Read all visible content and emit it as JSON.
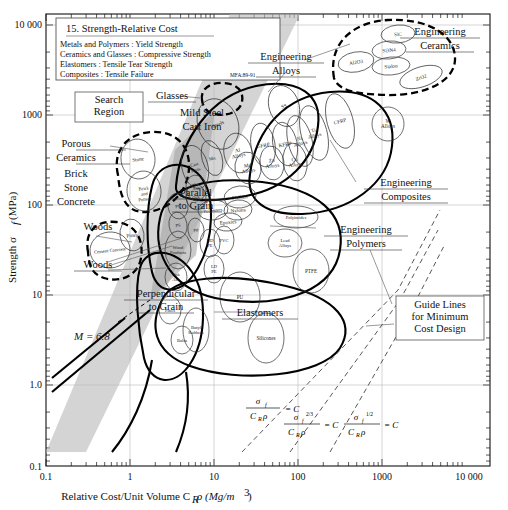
{
  "chart_data": {
    "type": "scatter",
    "title": "15. Strength-Relative Cost",
    "subtitle_lines": [
      "Metals and Polymers : Yield Strength",
      "Ceramics and Glasses : Compressive Strength",
      "Elastomers : Tensile Tear Strength",
      "Composites : Tensile Failure"
    ],
    "credit": "MFA:89-91",
    "xlabel": "Relative Cost/Unit Volume C",
    "xlabel_sub": "R",
    "xlabel_rest": "ρ (Mg/m",
    "xlabel_sup": "3",
    "xlabel_end": ")",
    "ylabel_pre": "Strength σ",
    "ylabel_sub": "f",
    "ylabel_post": "(MPa)",
    "xticks": [
      "0.1",
      "1",
      "10",
      "100",
      "1000",
      "10 000"
    ],
    "yticks": [
      "10 000",
      "1000",
      "100",
      "10",
      "1.0",
      "0.1"
    ],
    "xlim": [
      0.1,
      10000
    ],
    "ylim": [
      0.1,
      10000
    ],
    "grid": true,
    "index_line": "M = 6.8",
    "families": [
      {
        "name": "Engineering Alloys",
        "lines": [
          "Engineering",
          "Alloys"
        ]
      },
      {
        "name": "Engineering Ceramics",
        "lines": [
          "Engineering",
          "Ceramics"
        ]
      },
      {
        "name": "Engineering Composites",
        "lines": [
          "Engineering",
          "Composites"
        ]
      },
      {
        "name": "Engineering Polymers",
        "lines": [
          "Engineering",
          "Polymers"
        ]
      },
      {
        "name": "Porous Ceramics",
        "lines": [
          "Porous",
          "Ceramics"
        ]
      },
      {
        "name": "Elastomers",
        "lines": [
          "Elastomers"
        ]
      },
      {
        "name": "Glasses",
        "lines": [
          "Glasses"
        ]
      },
      {
        "name": "Woods",
        "lines": [
          "Woods"
        ]
      }
    ],
    "group_labels": [
      {
        "id": "mild-steel-cast-iron",
        "lines": [
          "Mild Steel",
          "Cast Iron"
        ]
      },
      {
        "id": "brick-stone-concrete",
        "lines": [
          "Brick",
          "Stone",
          "Concrete"
        ]
      },
      {
        "id": "woods-upper",
        "lines": [
          "Woods"
        ]
      },
      {
        "id": "woods-lower",
        "lines": [
          "Woods"
        ]
      },
      {
        "id": "parallel-to-grain",
        "lines": [
          "Parallel",
          "to Grain"
        ]
      },
      {
        "id": "perpendicular-to-grain",
        "lines": [
          "Perpendicular",
          "to Grain"
        ]
      }
    ],
    "boxes": [
      {
        "id": "search-region",
        "lines": [
          "Search",
          "Region"
        ]
      },
      {
        "id": "guide-lines",
        "lines": [
          "Guide Lines",
          "for Minimum",
          "Cost Design"
        ]
      }
    ],
    "guide_equations": [
      "σf / CRρ = C",
      "σf^2/3 / CRρ = C",
      "σf^1/2 / CRρ = C"
    ],
    "bubbles": [
      {
        "label": "SiC",
        "x": 398,
        "y": 34,
        "rx": 17,
        "ry": 9,
        "rot": -5
      },
      {
        "label": "Si3N4",
        "x": 389,
        "y": 50,
        "rx": 17,
        "ry": 9,
        "rot": -5
      },
      {
        "label": "Sialon",
        "x": 391,
        "y": 66,
        "rx": 19,
        "ry": 9,
        "rot": -5
      },
      {
        "label": "Al2O3",
        "x": 356,
        "y": 62,
        "rx": 18,
        "ry": 10,
        "rot": -10
      },
      {
        "label": "ZrO2",
        "x": 421,
        "y": 77,
        "rx": 22,
        "ry": 10,
        "rot": -18
      },
      {
        "label": "SS",
        "x": 284,
        "y": 106,
        "rx": 15,
        "ry": 21,
        "rot": -18
      },
      {
        "label": "Steels",
        "x": 218,
        "y": 124,
        "rx": 20,
        "ry": 26,
        "rot": -22
      },
      {
        "label": "CFRP",
        "x": 340,
        "y": 121,
        "rx": 13,
        "ry": 28,
        "rot": -15
      },
      {
        "label": "Ti Alloys",
        "x": 314,
        "y": 133,
        "rx": 13,
        "ry": 28,
        "rot": -15
      },
      {
        "label": "Ni Alloys",
        "x": 300,
        "y": 141,
        "rx": 12,
        "ry": 26,
        "rot": -14
      },
      {
        "label": "KFRP",
        "x": 285,
        "y": 144,
        "rx": 12,
        "ry": 22,
        "rot": -12
      },
      {
        "label": "W Alloys",
        "x": 388,
        "y": 124,
        "rx": 16,
        "ry": 17,
        "rot": 0
      },
      {
        "label": "Mn",
        "x": 212,
        "y": 158,
        "rx": 10,
        "ry": 18,
        "rot": -16
      },
      {
        "label": "Al Alloys",
        "x": 238,
        "y": 153,
        "rx": 14,
        "ry": 20,
        "rot": -12
      },
      {
        "label": "Mg Alloys",
        "x": 248,
        "y": 168,
        "rx": 13,
        "ry": 16,
        "rot": -10
      },
      {
        "label": "Zn Alloys",
        "x": 272,
        "y": 163,
        "rx": 12,
        "ry": 17,
        "rot": -8
      },
      {
        "label": "Cu Alloys",
        "x": 295,
        "y": 162,
        "rx": 12,
        "ry": 19,
        "rot": -8
      },
      {
        "label": "GFRP",
        "x": 263,
        "y": 145,
        "rx": 12,
        "ry": 22,
        "rot": -10
      },
      {
        "label": "Cast Irons",
        "x": 195,
        "y": 167,
        "rx": 13,
        "ry": 22,
        "rot": -14
      },
      {
        "label": "PMMA",
        "x": 240,
        "y": 197,
        "rx": 16,
        "ry": 11,
        "rot": -6
      },
      {
        "label": "Polyesters",
        "x": 213,
        "y": 210,
        "rx": 15,
        "ry": 10,
        "rot": -6
      },
      {
        "label": "Nylons",
        "x": 238,
        "y": 210,
        "rx": 14,
        "ry": 10,
        "rot": -6
      },
      {
        "label": "Epoxies",
        "x": 228,
        "y": 222,
        "rx": 14,
        "ry": 9,
        "rot": -6
      },
      {
        "label": "PS",
        "x": 178,
        "y": 225,
        "rx": 9,
        "ry": 13,
        "rot": -8
      },
      {
        "label": "PP",
        "x": 196,
        "y": 230,
        "rx": 8,
        "ry": 12,
        "rot": -8
      },
      {
        "label": "PC",
        "x": 178,
        "y": 206,
        "rx": 10,
        "ry": 13,
        "rot": -8
      },
      {
        "label": "HD PE",
        "x": 210,
        "y": 243,
        "rx": 10,
        "ry": 14,
        "rot": 0
      },
      {
        "label": "PVC",
        "x": 224,
        "y": 240,
        "rx": 10,
        "ry": 14,
        "rot": 0
      },
      {
        "label": "LD PE",
        "x": 214,
        "y": 269,
        "rx": 10,
        "ry": 14,
        "rot": 0
      },
      {
        "label": "Polyimides",
        "x": 296,
        "y": 217,
        "rx": 22,
        "ry": 11,
        "rot": 0
      },
      {
        "label": "Lead Alloys",
        "x": 285,
        "y": 243,
        "rx": 17,
        "ry": 14,
        "rot": 0
      },
      {
        "label": "PTFE",
        "x": 311,
        "y": 271,
        "rx": 18,
        "ry": 22,
        "rot": 0
      },
      {
        "label": "PU",
        "x": 240,
        "y": 297,
        "rx": 20,
        "ry": 25,
        "rot": 0
      },
      {
        "label": "Stone",
        "x": 138,
        "y": 159,
        "rx": 17,
        "ry": 20,
        "rot": -8
      },
      {
        "label": "Brick and Pottery",
        "x": 144,
        "y": 191,
        "rx": 17,
        "ry": 20,
        "rot": -6
      },
      {
        "label": "Cement Concrete",
        "x": 110,
        "y": 250,
        "rx": 20,
        "ry": 18,
        "rot": -6
      },
      {
        "label": "Pines",
        "x": 132,
        "y": 235,
        "rx": 12,
        "ry": 16,
        "rot": -8
      },
      {
        "label": "Oak",
        "x": 196,
        "y": 197,
        "rx": 10,
        "ry": 13,
        "rot": -8
      },
      {
        "label": "Ash",
        "x": 196,
        "y": 188,
        "rx": 10,
        "ry": 13,
        "rot": -8
      },
      {
        "label": "Wood Products",
        "x": 178,
        "y": 250,
        "rx": 13,
        "ry": 19,
        "rot": 0
      },
      {
        "label": "Oak Ash",
        "x": 176,
        "y": 277,
        "rx": 11,
        "ry": 14,
        "rot": 0
      },
      {
        "label": "Pines",
        "x": 170,
        "y": 310,
        "rx": 11,
        "ry": 14,
        "rot": 0
      },
      {
        "label": "Balsa",
        "x": 182,
        "y": 340,
        "rx": 11,
        "ry": 14,
        "rot": 0
      },
      {
        "label": "Butyl Rubbers",
        "x": 196,
        "y": 330,
        "rx": 13,
        "ry": 22,
        "rot": 0
      },
      {
        "label": "Silicones",
        "x": 266,
        "y": 338,
        "rx": 18,
        "ry": 25,
        "rot": 0
      }
    ]
  }
}
